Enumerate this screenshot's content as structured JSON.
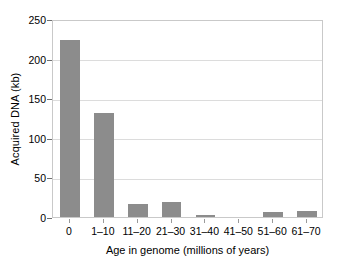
{
  "chart_data": {
    "type": "bar",
    "title": "",
    "xlabel": "Age in genome (millions of years)",
    "ylabel": "Acquired DNA (kb)",
    "categories": [
      "0",
      "1–10",
      "11–20",
      "21–30",
      "31–40",
      "41–50",
      "51–60",
      "61–70"
    ],
    "values": [
      223,
      131,
      17,
      19,
      3,
      0,
      6,
      8
    ],
    "ylim": [
      0,
      250
    ],
    "yticks": [
      0,
      50,
      100,
      150,
      200,
      250
    ],
    "ytick_labels": [
      "0",
      "50",
      "100",
      "150",
      "200",
      "250"
    ],
    "grid": "horizontal",
    "legend": "none",
    "series": [
      {
        "name": "Acquired DNA",
        "color": "#8c8c8c",
        "values": [
          223,
          131,
          17,
          19,
          3,
          0,
          6,
          8
        ]
      }
    ],
    "colors": {
      "bar": "#8c8c8c",
      "gridline": "#dcdcdc",
      "frame": "#c9c9c9",
      "text": "#000000",
      "background": "#ffffff"
    }
  }
}
